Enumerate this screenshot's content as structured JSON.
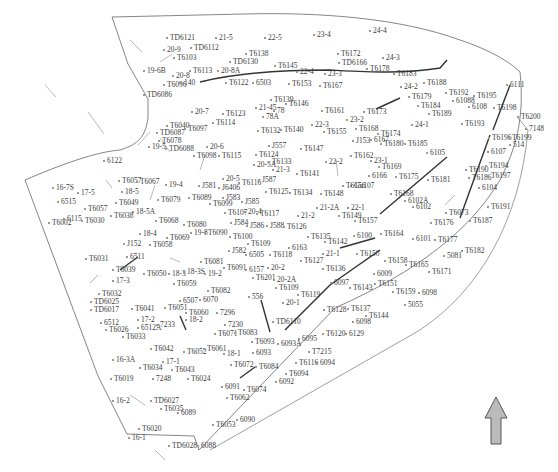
{
  "map": {
    "type": "site-plan",
    "background": "#ffffff",
    "line_color": "#555555",
    "labels": [
      {
        "t": "TD6121",
        "x": 166,
        "y": 34
      },
      {
        "t": "21-5",
        "x": 215,
        "y": 34
      },
      {
        "t": "22-5",
        "x": 264,
        "y": 34
      },
      {
        "t": "23-4",
        "x": 313,
        "y": 31
      },
      {
        "t": "24-4",
        "x": 369,
        "y": 27
      },
      {
        "t": "20-9",
        "x": 163,
        "y": 46
      },
      {
        "t": "TD6112",
        "x": 190,
        "y": 44
      },
      {
        "t": "T6103",
        "x": 173,
        "y": 54
      },
      {
        "t": "T6138",
        "x": 245,
        "y": 50
      },
      {
        "t": "T6172",
        "x": 337,
        "y": 50
      },
      {
        "t": "TD6166",
        "x": 338,
        "y": 59
      },
      {
        "t": "24-3",
        "x": 382,
        "y": 54
      },
      {
        "t": "TD6130",
        "x": 229,
        "y": 58
      },
      {
        "t": "19-6B",
        "x": 143,
        "y": 67
      },
      {
        "t": "T6113",
        "x": 189,
        "y": 67
      },
      {
        "t": "20-8A",
        "x": 217,
        "y": 67
      },
      {
        "t": "T6145",
        "x": 274,
        "y": 62
      },
      {
        "t": "22-4",
        "x": 296,
        "y": 68
      },
      {
        "t": "23-3",
        "x": 324,
        "y": 70
      },
      {
        "t": "T6178",
        "x": 366,
        "y": 65
      },
      {
        "t": "T6183",
        "x": 393,
        "y": 70
      },
      {
        "t": "20-8",
        "x": 172,
        "y": 72
      },
      {
        "t": "T6096",
        "x": 163,
        "y": 81
      },
      {
        "t": "140",
        "x": 180,
        "y": 79
      },
      {
        "t": "T6122",
        "x": 225,
        "y": 79
      },
      {
        "t": "6503",
        "x": 252,
        "y": 79
      },
      {
        "t": "T6153",
        "x": 288,
        "y": 80
      },
      {
        "t": "T6167",
        "x": 319,
        "y": 82
      },
      {
        "t": "24-2",
        "x": 400,
        "y": 83
      },
      {
        "t": "T6188",
        "x": 423,
        "y": 79
      },
      {
        "t": "T6192",
        "x": 445,
        "y": 89
      },
      {
        "t": "T6195",
        "x": 473,
        "y": 92
      },
      {
        "t": "61088",
        "x": 452,
        "y": 97
      },
      {
        "t": "6111",
        "x": 506,
        "y": 81
      },
      {
        "t": "TD6086",
        "x": 143,
        "y": 91
      },
      {
        "t": "T6139",
        "x": 270,
        "y": 96
      },
      {
        "t": "T6146",
        "x": 285,
        "y": 100
      },
      {
        "t": "T6179",
        "x": 408,
        "y": 93
      },
      {
        "t": "6108",
        "x": 468,
        "y": 103
      },
      {
        "t": "T6198",
        "x": 493,
        "y": 104
      },
      {
        "t": "T6184",
        "x": 417,
        "y": 102
      },
      {
        "t": "T6189",
        "x": 428,
        "y": 110
      },
      {
        "t": "20-7",
        "x": 191,
        "y": 108
      },
      {
        "t": "T6123",
        "x": 222,
        "y": 110
      },
      {
        "t": "21-45",
        "x": 255,
        "y": 104
      },
      {
        "t": "78",
        "x": 273,
        "y": 107
      },
      {
        "t": "78A",
        "x": 262,
        "y": 113
      },
      {
        "t": "T6161",
        "x": 321,
        "y": 107
      },
      {
        "t": "T6173",
        "x": 363,
        "y": 108
      },
      {
        "t": "23-2",
        "x": 346,
        "y": 116
      },
      {
        "t": "T6200",
        "x": 517,
        "y": 113
      },
      {
        "t": "T6114",
        "x": 212,
        "y": 119
      },
      {
        "t": "T6040",
        "x": 166,
        "y": 122
      },
      {
        "t": "TD6087",
        "x": 156,
        "y": 129
      },
      {
        "t": "T6097",
        "x": 184,
        "y": 125
      },
      {
        "t": "22-3",
        "x": 311,
        "y": 121
      },
      {
        "t": "T6140",
        "x": 280,
        "y": 126
      },
      {
        "t": "T6132",
        "x": 257,
        "y": 127
      },
      {
        "t": "T6155",
        "x": 323,
        "y": 128
      },
      {
        "t": "T6168",
        "x": 355,
        "y": 125
      },
      {
        "t": "T6174",
        "x": 377,
        "y": 130
      },
      {
        "t": "24-1",
        "x": 411,
        "y": 121
      },
      {
        "t": "T6193",
        "x": 461,
        "y": 120
      },
      {
        "t": "7148",
        "x": 525,
        "y": 125
      },
      {
        "t": "T6078",
        "x": 158,
        "y": 137
      },
      {
        "t": "J153",
        "x": 352,
        "y": 137
      },
      {
        "t": "6167",
        "x": 370,
        "y": 136
      },
      {
        "t": "T6180",
        "x": 380,
        "y": 140
      },
      {
        "t": "T6185",
        "x": 404,
        "y": 140
      },
      {
        "t": "T6196",
        "x": 488,
        "y": 134
      },
      {
        "t": "T6199",
        "x": 508,
        "y": 134
      },
      {
        "t": "514",
        "x": 509,
        "y": 141
      },
      {
        "t": "19-5",
        "x": 148,
        "y": 143
      },
      {
        "t": "TD6088",
        "x": 165,
        "y": 145
      },
      {
        "t": "20-6",
        "x": 206,
        "y": 143
      },
      {
        "t": "T6098",
        "x": 193,
        "y": 152
      },
      {
        "t": "T6115",
        "x": 218,
        "y": 152
      },
      {
        "t": "J557",
        "x": 268,
        "y": 142
      },
      {
        "t": "T6147",
        "x": 300,
        "y": 145
      },
      {
        "t": "6105",
        "x": 426,
        "y": 149
      },
      {
        "t": "6107",
        "x": 487,
        "y": 148
      },
      {
        "t": "6122",
        "x": 103,
        "y": 157
      },
      {
        "t": "T6124",
        "x": 255,
        "y": 151
      },
      {
        "t": "T6162",
        "x": 350,
        "y": 152
      },
      {
        "t": "23-1",
        "x": 370,
        "y": 157
      },
      {
        "t": "22-2",
        "x": 325,
        "y": 158
      },
      {
        "t": "20-5A",
        "x": 253,
        "y": 161
      },
      {
        "t": "T6133",
        "x": 268,
        "y": 158
      },
      {
        "t": "21-3",
        "x": 272,
        "y": 166
      },
      {
        "t": "T6169",
        "x": 378,
        "y": 163
      },
      {
        "t": "T6190",
        "x": 465,
        "y": 166
      },
      {
        "t": "T6194",
        "x": 485,
        "y": 162
      },
      {
        "t": "T6141",
        "x": 296,
        "y": 170
      },
      {
        "t": "6166",
        "x": 368,
        "y": 172
      },
      {
        "t": "T6175",
        "x": 395,
        "y": 173
      },
      {
        "t": "T6186",
        "x": 468,
        "y": 174
      },
      {
        "t": "T6197",
        "x": 487,
        "y": 172
      },
      {
        "t": "T6057",
        "x": 118,
        "y": 177
      },
      {
        "t": "T6067",
        "x": 136,
        "y": 178
      },
      {
        "t": "20-5",
        "x": 222,
        "y": 175
      },
      {
        "t": "T6116",
        "x": 238,
        "y": 179
      },
      {
        "t": "J587",
        "x": 258,
        "y": 176
      },
      {
        "t": "T6181",
        "x": 427,
        "y": 176
      },
      {
        "t": "Gu107",
        "x": 350,
        "y": 182
      },
      {
        "t": "6104",
        "x": 478,
        "y": 184
      },
      {
        "t": "16-7S",
        "x": 52,
        "y": 184
      },
      {
        "t": "17-5",
        "x": 77,
        "y": 189
      },
      {
        "t": "19-4",
        "x": 165,
        "y": 181
      },
      {
        "t": "J581",
        "x": 198,
        "y": 182
      },
      {
        "t": "J6406",
        "x": 218,
        "y": 184
      },
      {
        "t": "18-5",
        "x": 121,
        "y": 188
      },
      {
        "t": "T6156",
        "x": 342,
        "y": 182
      },
      {
        "t": "T6134",
        "x": 289,
        "y": 189
      },
      {
        "t": "T6148",
        "x": 320,
        "y": 190
      },
      {
        "t": "T6125",
        "x": 265,
        "y": 188
      },
      {
        "t": "6515",
        "x": 57,
        "y": 198
      },
      {
        "t": "T6057",
        "x": 84,
        "y": 205
      },
      {
        "t": "T6049",
        "x": 115,
        "y": 199
      },
      {
        "t": "T6079",
        "x": 157,
        "y": 196
      },
      {
        "t": "T6089",
        "x": 188,
        "y": 194
      },
      {
        "t": "J583",
        "x": 222,
        "y": 194
      },
      {
        "t": "J585",
        "x": 241,
        "y": 198
      },
      {
        "t": "T6099",
        "x": 209,
        "y": 200
      },
      {
        "t": "T6168",
        "x": 390,
        "y": 190
      },
      {
        "t": "6102A",
        "x": 404,
        "y": 197
      },
      {
        "t": "6102",
        "x": 412,
        "y": 203
      },
      {
        "t": "18-5A",
        "x": 132,
        "y": 208
      },
      {
        "t": "T6107",
        "x": 224,
        "y": 209
      },
      {
        "t": "20-4",
        "x": 244,
        "y": 208
      },
      {
        "t": "T6117",
        "x": 256,
        "y": 210
      },
      {
        "t": "21-2A",
        "x": 316,
        "y": 204
      },
      {
        "t": "22-1",
        "x": 347,
        "y": 204
      },
      {
        "t": "T6149",
        "x": 338,
        "y": 212
      },
      {
        "t": "T6073",
        "x": 445,
        "y": 209
      },
      {
        "t": "T6191",
        "x": 487,
        "y": 203
      },
      {
        "t": "T6002",
        "x": 48,
        "y": 219
      },
      {
        "t": "6115",
        "x": 63,
        "y": 215
      },
      {
        "t": "T6030",
        "x": 81,
        "y": 217
      },
      {
        "t": "T6038",
        "x": 110,
        "y": 212
      },
      {
        "t": "T6068",
        "x": 155,
        "y": 217
      },
      {
        "t": "21-2",
        "x": 297,
        "y": 212
      },
      {
        "t": "T6176",
        "x": 430,
        "y": 219
      },
      {
        "t": "T6187",
        "x": 469,
        "y": 217
      },
      {
        "t": "T6080",
        "x": 183,
        "y": 221
      },
      {
        "t": "J584",
        "x": 230,
        "y": 219
      },
      {
        "t": "J586",
        "x": 246,
        "y": 222
      },
      {
        "t": "J588",
        "x": 266,
        "y": 222
      },
      {
        "t": "T6126",
        "x": 283,
        "y": 223
      },
      {
        "t": "T6157",
        "x": 354,
        "y": 217
      },
      {
        "t": "18-4",
        "x": 139,
        "y": 230
      },
      {
        "t": "19-8",
        "x": 190,
        "y": 229
      },
      {
        "t": "T6090",
        "x": 204,
        "y": 229
      },
      {
        "t": "T6069",
        "x": 166,
        "y": 234
      },
      {
        "t": "T6100",
        "x": 229,
        "y": 233
      },
      {
        "t": "T6135",
        "x": 307,
        "y": 233
      },
      {
        "t": "T6142",
        "x": 324,
        "y": 238
      },
      {
        "t": "6100",
        "x": 353,
        "y": 232
      },
      {
        "t": "T6164",
        "x": 380,
        "y": 230
      },
      {
        "t": "6101",
        "x": 412,
        "y": 235
      },
      {
        "t": "T6177",
        "x": 434,
        "y": 236
      },
      {
        "t": "J152",
        "x": 123,
        "y": 240
      },
      {
        "t": "T6058",
        "x": 149,
        "y": 241
      },
      {
        "t": "T6109",
        "x": 247,
        "y": 240
      },
      {
        "t": "6163",
        "x": 288,
        "y": 244
      },
      {
        "t": "T6182",
        "x": 461,
        "y": 247
      },
      {
        "t": "5081",
        "x": 443,
        "y": 252
      },
      {
        "t": "J582",
        "x": 228,
        "y": 247
      },
      {
        "t": "6505",
        "x": 245,
        "y": 251
      },
      {
        "t": "T6118",
        "x": 269,
        "y": 251
      },
      {
        "t": "T6127",
        "x": 300,
        "y": 257
      },
      {
        "t": "21-1",
        "x": 322,
        "y": 250
      },
      {
        "t": "T6150",
        "x": 356,
        "y": 250
      },
      {
        "t": "T6031",
        "x": 85,
        "y": 255
      },
      {
        "t": "6511",
        "x": 126,
        "y": 253
      },
      {
        "t": "T6158",
        "x": 384,
        "y": 257
      },
      {
        "t": "T6165",
        "x": 405,
        "y": 261
      },
      {
        "t": "T6081",
        "x": 200,
        "y": 258
      },
      {
        "t": "T6091",
        "x": 223,
        "y": 264
      },
      {
        "t": "6157",
        "x": 245,
        "y": 266
      },
      {
        "t": "20-2",
        "x": 267,
        "y": 264
      },
      {
        "t": "T6136",
        "x": 322,
        "y": 265
      },
      {
        "t": "T6171",
        "x": 428,
        "y": 268
      },
      {
        "t": "T6039",
        "x": 112,
        "y": 266
      },
      {
        "t": "T6050",
        "x": 143,
        "y": 270
      },
      {
        "t": "18-3",
        "x": 168,
        "y": 270
      },
      {
        "t": "18-3S",
        "x": 183,
        "y": 268
      },
      {
        "t": "19-2",
        "x": 204,
        "y": 270
      },
      {
        "t": "T6201",
        "x": 252,
        "y": 274
      },
      {
        "t": "20-2A",
        "x": 273,
        "y": 276
      },
      {
        "t": "6009",
        "x": 373,
        "y": 270
      },
      {
        "t": "17-3",
        "x": 112,
        "y": 277
      },
      {
        "t": "T6059",
        "x": 173,
        "y": 280
      },
      {
        "t": "T6109",
        "x": 275,
        "y": 284
      },
      {
        "t": "6097",
        "x": 330,
        "y": 279
      },
      {
        "t": "T6143",
        "x": 349,
        "y": 284
      },
      {
        "t": "T6151",
        "x": 374,
        "y": 280
      },
      {
        "t": "T6159",
        "x": 392,
        "y": 288
      },
      {
        "t": "6098",
        "x": 418,
        "y": 289
      },
      {
        "t": "T6082",
        "x": 207,
        "y": 287
      },
      {
        "t": "T6032",
        "x": 98,
        "y": 290
      },
      {
        "t": "T6119",
        "x": 297,
        "y": 291
      },
      {
        "t": "556",
        "x": 248,
        "y": 293
      },
      {
        "t": "TD6025",
        "x": 90,
        "y": 298
      },
      {
        "t": "6507",
        "x": 179,
        "y": 297
      },
      {
        "t": "6070",
        "x": 199,
        "y": 296
      },
      {
        "t": "20-1",
        "x": 282,
        "y": 299
      },
      {
        "t": "5055",
        "x": 404,
        "y": 301
      },
      {
        "t": "TD6017",
        "x": 90,
        "y": 306
      },
      {
        "t": "T6041",
        "x": 131,
        "y": 305
      },
      {
        "t": "T6051",
        "x": 164,
        "y": 304
      },
      {
        "t": "T6060",
        "x": 185,
        "y": 309
      },
      {
        "t": "7296",
        "x": 216,
        "y": 309
      },
      {
        "t": "T6128",
        "x": 323,
        "y": 306
      },
      {
        "t": "T6137",
        "x": 347,
        "y": 305
      },
      {
        "t": "T6144",
        "x": 365,
        "y": 312
      },
      {
        "t": "6512",
        "x": 100,
        "y": 319
      },
      {
        "t": "17-2",
        "x": 137,
        "y": 316
      },
      {
        "t": "18-2",
        "x": 185,
        "y": 316
      },
      {
        "t": "TD6110",
        "x": 272,
        "y": 318
      },
      {
        "t": "T6026",
        "x": 105,
        "y": 326
      },
      {
        "t": "6512A",
        "x": 137,
        "y": 324
      },
      {
        "t": "7233",
        "x": 156,
        "y": 321
      },
      {
        "t": "7230",
        "x": 224,
        "y": 321
      },
      {
        "t": "6098",
        "x": 352,
        "y": 318
      },
      {
        "t": "T6033",
        "x": 122,
        "y": 333
      },
      {
        "t": "T6071",
        "x": 214,
        "y": 330
      },
      {
        "t": "T6083",
        "x": 234,
        "y": 329
      },
      {
        "t": "T6093",
        "x": 251,
        "y": 338
      },
      {
        "t": "6093A",
        "x": 277,
        "y": 340
      },
      {
        "t": "6095",
        "x": 298,
        "y": 335
      },
      {
        "t": "T6120",
        "x": 322,
        "y": 330
      },
      {
        "t": "6129",
        "x": 345,
        "y": 330
      },
      {
        "t": "T6042",
        "x": 150,
        "y": 345
      },
      {
        "t": "T6052",
        "x": 183,
        "y": 348
      },
      {
        "t": "T6061",
        "x": 203,
        "y": 345
      },
      {
        "t": "18-1",
        "x": 223,
        "y": 350
      },
      {
        "t": "6093",
        "x": 252,
        "y": 349
      },
      {
        "t": "T7215",
        "x": 308,
        "y": 348
      },
      {
        "t": "16-3A",
        "x": 112,
        "y": 356
      },
      {
        "t": "17-1",
        "x": 162,
        "y": 358
      },
      {
        "t": "T6034",
        "x": 139,
        "y": 364
      },
      {
        "t": "T6043",
        "x": 171,
        "y": 366
      },
      {
        "t": "T6072",
        "x": 230,
        "y": 361
      },
      {
        "t": "T6084",
        "x": 255,
        "y": 363
      },
      {
        "t": "T6116",
        "x": 295,
        "y": 359
      },
      {
        "t": "6094",
        "x": 316,
        "y": 359
      },
      {
        "t": "T6094",
        "x": 285,
        "y": 370
      },
      {
        "t": "6092",
        "x": 275,
        "y": 378
      },
      {
        "t": "T6019",
        "x": 110,
        "y": 375
      },
      {
        "t": "7248",
        "x": 152,
        "y": 375
      },
      {
        "t": "T6024",
        "x": 187,
        "y": 375
      },
      {
        "t": "6091",
        "x": 221,
        "y": 383
      },
      {
        "t": "T6074",
        "x": 243,
        "y": 386
      },
      {
        "t": "T6062",
        "x": 226,
        "y": 394
      },
      {
        "t": "16-2",
        "x": 112,
        "y": 397
      },
      {
        "t": "TD6027",
        "x": 150,
        "y": 397
      },
      {
        "t": "T6035",
        "x": 160,
        "y": 405
      },
      {
        "t": "6089",
        "x": 177,
        "y": 409
      },
      {
        "t": "6090",
        "x": 236,
        "y": 416
      },
      {
        "t": "T6053",
        "x": 212,
        "y": 421
      },
      {
        "t": "T6020",
        "x": 138,
        "y": 425
      },
      {
        "t": "16-1",
        "x": 128,
        "y": 434
      },
      {
        "t": "TD6028",
        "x": 168,
        "y": 442
      },
      {
        "t": "6088",
        "x": 197,
        "y": 442
      }
    ]
  },
  "north_arrow": {
    "label": "north-arrow",
    "fill": "#bbbbbb",
    "stroke": "#555555"
  }
}
